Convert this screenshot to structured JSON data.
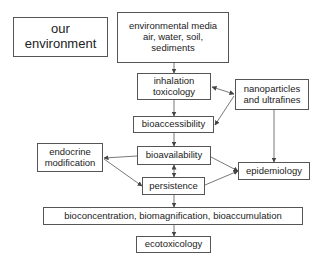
{
  "diagram": {
    "nodes": {
      "our_environment": {
        "lines": [
          "our",
          "environment"
        ]
      },
      "environmental_media": {
        "lines": [
          "environmental media",
          "air, water, soil,",
          "sediments"
        ]
      },
      "inhalation_toxicology": {
        "lines": [
          "inhalation",
          "toxicology"
        ]
      },
      "nanoparticles": {
        "lines": [
          "nanoparticles",
          "and ultrafines"
        ]
      },
      "bioaccessibility": {
        "label": "bioaccessibility"
      },
      "endocrine_modification": {
        "lines": [
          "endocrine",
          "modification"
        ]
      },
      "bioavailability": {
        "label": "bioavailability"
      },
      "epidemiology": {
        "label": "epidemiology"
      },
      "persistence": {
        "label": "persistence"
      },
      "bioconcentration": {
        "label": "bioconcentration, biomagnification, bioaccumulation"
      },
      "ecotoxicology": {
        "label": "ecotoxicology"
      }
    },
    "edges": [
      {
        "from": "environmental_media",
        "to": "inhalation_toxicology"
      },
      {
        "from": "inhalation_toxicology",
        "to": "bioaccessibility"
      },
      {
        "from": "bioaccessibility",
        "to": "bioavailability"
      },
      {
        "from": "bioavailability",
        "to": "persistence",
        "bidirectional": true
      },
      {
        "from": "persistence",
        "to": "bioconcentration"
      },
      {
        "from": "bioconcentration",
        "to": "ecotoxicology"
      },
      {
        "from": "nanoparticles",
        "to": "inhalation_toxicology",
        "bidirectional": true
      },
      {
        "from": "nanoparticles",
        "to": "bioaccessibility"
      },
      {
        "from": "nanoparticles",
        "to": "epidemiology"
      },
      {
        "from": "bioavailability",
        "to": "endocrine_modification"
      },
      {
        "from": "endocrine_modification",
        "to": "persistence"
      },
      {
        "from": "bioavailability",
        "to": "epidemiology"
      },
      {
        "from": "persistence",
        "to": "epidemiology"
      }
    ]
  }
}
